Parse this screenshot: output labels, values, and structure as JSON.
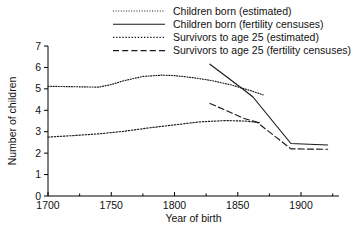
{
  "chart_data": {
    "type": "line",
    "title": "",
    "xlabel": "Year of birth",
    "ylabel": "Number of children",
    "xlim": [
      1700,
      1930
    ],
    "ylim": [
      0,
      7
    ],
    "xticks": [
      1700,
      1750,
      1800,
      1850,
      1900
    ],
    "xticklabels": [
      "1700",
      "1750",
      "1800",
      "1850",
      "1900"
    ],
    "xminorticks": [
      1725,
      1775,
      1825,
      1875,
      1925
    ],
    "yticks": [
      0,
      1,
      2,
      3,
      4,
      5,
      6,
      7
    ],
    "yticklabels": [
      "0",
      "1",
      "2",
      "3",
      "4",
      "5",
      "6",
      "7"
    ],
    "grid": false,
    "legend_position": "top-right",
    "series": [
      {
        "name": "Children born (estimated)",
        "style": "dotted-fine",
        "color": "#1a1a1a",
        "points": [
          [
            1700,
            5.12
          ],
          [
            1720,
            5.1
          ],
          [
            1740,
            5.08
          ],
          [
            1750,
            5.2
          ],
          [
            1760,
            5.38
          ],
          [
            1775,
            5.58
          ],
          [
            1790,
            5.64
          ],
          [
            1800,
            5.62
          ],
          [
            1815,
            5.52
          ],
          [
            1830,
            5.38
          ],
          [
            1845,
            5.18
          ],
          [
            1860,
            4.92
          ],
          [
            1870,
            4.72
          ]
        ]
      },
      {
        "name": "Children born (fertility censuses)",
        "style": "solid",
        "color": "#1a1a1a",
        "points": [
          [
            1828,
            6.15
          ],
          [
            1855,
            4.95
          ],
          [
            1862,
            4.62
          ],
          [
            1892,
            2.45
          ],
          [
            1921,
            2.38
          ]
        ]
      },
      {
        "name": "Survivors to age 25 (estimated)",
        "style": "dotted-coarse",
        "color": "#1a1a1a",
        "points": [
          [
            1700,
            2.75
          ],
          [
            1720,
            2.82
          ],
          [
            1740,
            2.9
          ],
          [
            1760,
            3.02
          ],
          [
            1780,
            3.18
          ],
          [
            1800,
            3.32
          ],
          [
            1820,
            3.46
          ],
          [
            1840,
            3.52
          ],
          [
            1855,
            3.5
          ],
          [
            1868,
            3.42
          ]
        ]
      },
      {
        "name": "Survivors to age 25 (fertility censuses)",
        "style": "dashed",
        "color": "#1a1a1a",
        "points": [
          [
            1828,
            4.32
          ],
          [
            1855,
            3.62
          ],
          [
            1865,
            3.45
          ],
          [
            1892,
            2.2
          ],
          [
            1921,
            2.18
          ]
        ]
      }
    ]
  }
}
